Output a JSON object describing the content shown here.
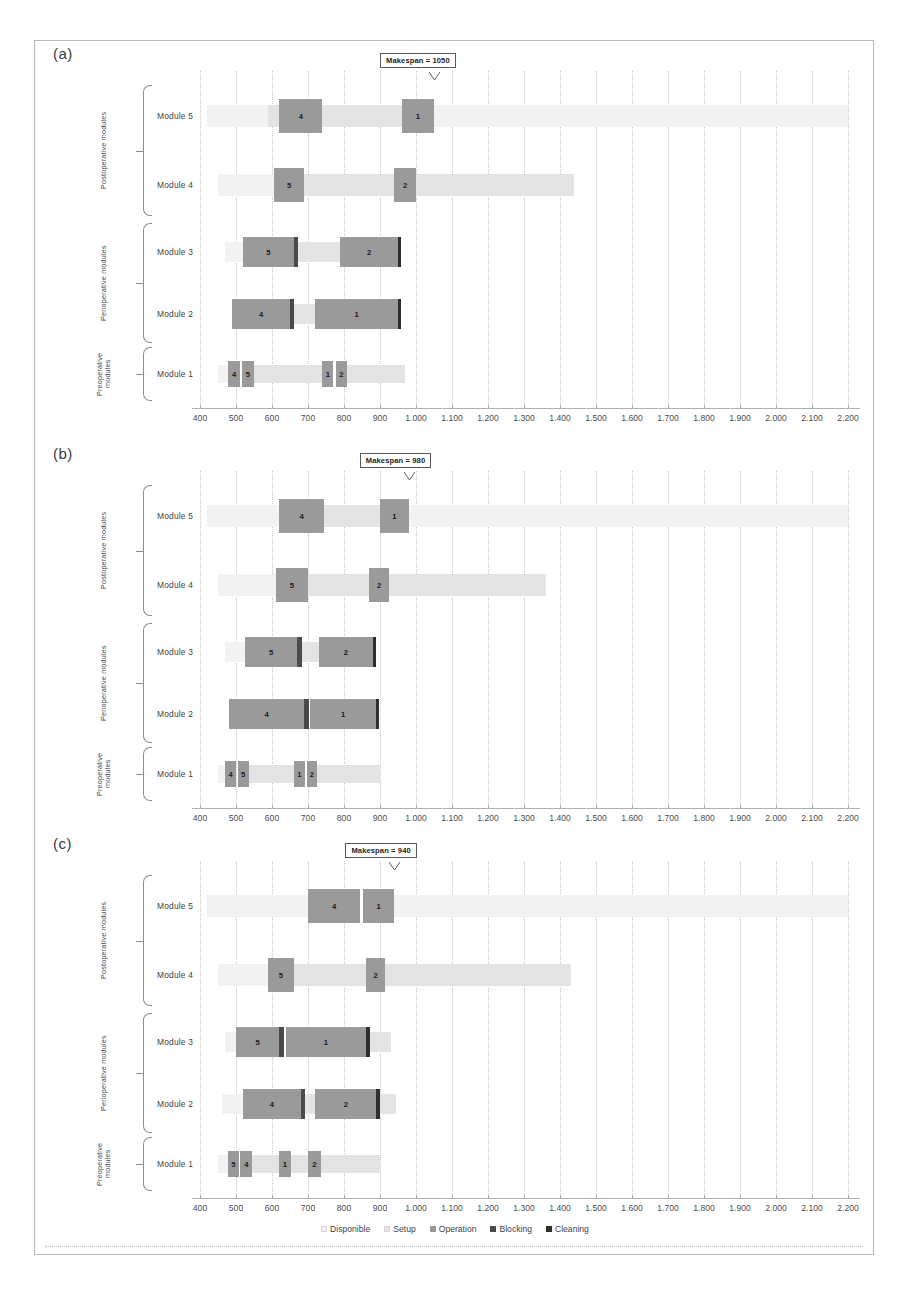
{
  "figure": {
    "axis": {
      "min": 400,
      "max": 2200,
      "step": 100,
      "tick_labels": [
        "400",
        "500",
        "600",
        "700",
        "800",
        "900",
        "1.000",
        "1.100",
        "1.200",
        "1.300",
        "1.400",
        "1.500",
        "1.600",
        "1.700",
        "1.800",
        "1.900",
        "2.000",
        "2.100",
        "2.200"
      ]
    },
    "groups": [
      {
        "label": "Postoperative modules",
        "rows": [
          "Module 5",
          "Module 4"
        ]
      },
      {
        "label": "Perioperative modules",
        "rows": [
          "Module 3",
          "Module 2"
        ]
      },
      {
        "label": "Preoperative modules",
        "rows": [
          "Module 1"
        ]
      }
    ],
    "legend": {
      "items": [
        {
          "label": "Disponible",
          "color": "#f2f2f2"
        },
        {
          "label": "Setup",
          "color": "#e3e3e3"
        },
        {
          "label": "Operation",
          "color": "#9a9a9a"
        },
        {
          "label": "Blocking",
          "color": "#4a4a4a"
        },
        {
          "label": "Cleaning",
          "color": "#2e2e2e"
        }
      ]
    },
    "colors": {
      "disponible": "#f2f2f2",
      "setup": "#e3e3e3",
      "operation": "#9a9a9a",
      "blocking": "#4a4a4a",
      "cleaning": "#2e2e2e",
      "grid": "#c4c4c4",
      "frame": "#b9b9b9",
      "text": "#3f3f3f"
    }
  },
  "chart_data": {
    "type": "bar",
    "chart_kind": "gantt",
    "xlabel": "",
    "ylabel": "",
    "xlim": [
      400,
      2200
    ],
    "grid": true,
    "legend_position": "bottom",
    "categories": [
      "Module 5",
      "Module 4",
      "Module 3",
      "Module 2",
      "Module 1"
    ],
    "panels": [
      {
        "id": "a",
        "label": "(a)",
        "makespan_label": "Makespan = 1050",
        "makespan_value": 1050,
        "rows": [
          {
            "name": "Module 5",
            "segments": [
              {
                "type": "disponible",
                "start": 420,
                "end": 590
              },
              {
                "type": "setup",
                "start": 590,
                "end": 620
              },
              {
                "type": "operation",
                "start": 620,
                "end": 740,
                "label": "4"
              },
              {
                "type": "setup",
                "start": 740,
                "end": 960
              },
              {
                "type": "operation",
                "start": 960,
                "end": 1050,
                "label": "1"
              },
              {
                "type": "disponible",
                "start": 1050,
                "end": 2200
              }
            ]
          },
          {
            "name": "Module 4",
            "segments": [
              {
                "type": "disponible",
                "start": 450,
                "end": 605
              },
              {
                "type": "operation",
                "start": 605,
                "end": 690,
                "label": "5"
              },
              {
                "type": "setup",
                "start": 690,
                "end": 940
              },
              {
                "type": "operation",
                "start": 940,
                "end": 1000,
                "label": "2"
              },
              {
                "type": "setup",
                "start": 1000,
                "end": 1440
              }
            ]
          },
          {
            "name": "Module 3",
            "segments": [
              {
                "type": "disponible",
                "start": 470,
                "end": 520
              },
              {
                "type": "operation",
                "start": 520,
                "end": 660,
                "label": "5"
              },
              {
                "type": "blocking",
                "start": 660,
                "end": 672
              },
              {
                "type": "setup",
                "start": 672,
                "end": 790
              },
              {
                "type": "operation",
                "start": 790,
                "end": 950,
                "label": "2"
              },
              {
                "type": "cleaning",
                "start": 950,
                "end": 958
              }
            ]
          },
          {
            "name": "Module 2",
            "segments": [
              {
                "type": "operation",
                "start": 490,
                "end": 650,
                "label": "4"
              },
              {
                "type": "blocking",
                "start": 650,
                "end": 662
              },
              {
                "type": "setup",
                "start": 662,
                "end": 720
              },
              {
                "type": "operation",
                "start": 720,
                "end": 950,
                "label": "1"
              },
              {
                "type": "cleaning",
                "start": 950,
                "end": 958
              }
            ]
          },
          {
            "name": "Module 1",
            "segments": [
              {
                "type": "disponible",
                "start": 450,
                "end": 478
              },
              {
                "type": "operation",
                "start": 478,
                "end": 512,
                "label": "4"
              },
              {
                "type": "operation",
                "start": 516,
                "end": 550,
                "label": "5"
              },
              {
                "type": "setup",
                "start": 550,
                "end": 740
              },
              {
                "type": "operation",
                "start": 740,
                "end": 770,
                "label": "1"
              },
              {
                "type": "operation",
                "start": 778,
                "end": 808,
                "label": "2"
              },
              {
                "type": "setup",
                "start": 808,
                "end": 970
              }
            ]
          }
        ]
      },
      {
        "id": "b",
        "label": "(b)",
        "makespan_label": "Makespan = 980",
        "makespan_value": 980,
        "rows": [
          {
            "name": "Module 5",
            "segments": [
              {
                "type": "disponible",
                "start": 420,
                "end": 620
              },
              {
                "type": "operation",
                "start": 620,
                "end": 745,
                "label": "4"
              },
              {
                "type": "setup",
                "start": 745,
                "end": 900
              },
              {
                "type": "operation",
                "start": 900,
                "end": 980,
                "label": "1"
              },
              {
                "type": "disponible",
                "start": 980,
                "end": 2200
              }
            ]
          },
          {
            "name": "Module 4",
            "segments": [
              {
                "type": "disponible",
                "start": 450,
                "end": 610
              },
              {
                "type": "operation",
                "start": 610,
                "end": 700,
                "label": "5"
              },
              {
                "type": "setup",
                "start": 700,
                "end": 870
              },
              {
                "type": "operation",
                "start": 870,
                "end": 925,
                "label": "2"
              },
              {
                "type": "setup",
                "start": 925,
                "end": 1360
              }
            ]
          },
          {
            "name": "Module 3",
            "segments": [
              {
                "type": "disponible",
                "start": 470,
                "end": 525
              },
              {
                "type": "operation",
                "start": 525,
                "end": 670,
                "label": "5"
              },
              {
                "type": "blocking",
                "start": 670,
                "end": 682
              },
              {
                "type": "setup",
                "start": 682,
                "end": 730
              },
              {
                "type": "operation",
                "start": 730,
                "end": 880,
                "label": "2"
              },
              {
                "type": "cleaning",
                "start": 880,
                "end": 888
              }
            ]
          },
          {
            "name": "Module 2",
            "segments": [
              {
                "type": "operation",
                "start": 480,
                "end": 690,
                "label": "4"
              },
              {
                "type": "blocking",
                "start": 690,
                "end": 702
              },
              {
                "type": "operation",
                "start": 705,
                "end": 890,
                "label": "1"
              },
              {
                "type": "cleaning",
                "start": 890,
                "end": 898
              }
            ]
          },
          {
            "name": "Module 1",
            "segments": [
              {
                "type": "disponible",
                "start": 450,
                "end": 470
              },
              {
                "type": "operation",
                "start": 470,
                "end": 500,
                "label": "4"
              },
              {
                "type": "operation",
                "start": 505,
                "end": 535,
                "label": "5"
              },
              {
                "type": "setup",
                "start": 535,
                "end": 660
              },
              {
                "type": "operation",
                "start": 660,
                "end": 692,
                "label": "1"
              },
              {
                "type": "operation",
                "start": 696,
                "end": 726,
                "label": "2"
              },
              {
                "type": "setup",
                "start": 726,
                "end": 900
              }
            ]
          }
        ]
      },
      {
        "id": "c",
        "label": "(c)",
        "makespan_label": "Makespan = 940",
        "makespan_value": 940,
        "rows": [
          {
            "name": "Module 5",
            "segments": [
              {
                "type": "disponible",
                "start": 420,
                "end": 700
              },
              {
                "type": "operation",
                "start": 700,
                "end": 845,
                "label": "4"
              },
              {
                "type": "operation",
                "start": 852,
                "end": 940,
                "label": "1"
              },
              {
                "type": "disponible",
                "start": 940,
                "end": 2200
              }
            ]
          },
          {
            "name": "Module 4",
            "segments": [
              {
                "type": "disponible",
                "start": 450,
                "end": 590
              },
              {
                "type": "operation",
                "start": 590,
                "end": 660,
                "label": "5"
              },
              {
                "type": "setup",
                "start": 660,
                "end": 860
              },
              {
                "type": "operation",
                "start": 860,
                "end": 915,
                "label": "2"
              },
              {
                "type": "setup",
                "start": 915,
                "end": 1430
              }
            ]
          },
          {
            "name": "Module 3",
            "segments": [
              {
                "type": "disponible",
                "start": 470,
                "end": 500
              },
              {
                "type": "operation",
                "start": 500,
                "end": 620,
                "label": "5"
              },
              {
                "type": "blocking",
                "start": 620,
                "end": 632
              },
              {
                "type": "operation",
                "start": 640,
                "end": 860,
                "label": "1"
              },
              {
                "type": "cleaning",
                "start": 860,
                "end": 872
              },
              {
                "type": "setup",
                "start": 872,
                "end": 930
              }
            ]
          },
          {
            "name": "Module 2",
            "segments": [
              {
                "type": "disponible",
                "start": 460,
                "end": 520
              },
              {
                "type": "operation",
                "start": 520,
                "end": 680,
                "label": "4"
              },
              {
                "type": "blocking",
                "start": 680,
                "end": 692
              },
              {
                "type": "setup",
                "start": 692,
                "end": 720
              },
              {
                "type": "operation",
                "start": 720,
                "end": 890,
                "label": "2"
              },
              {
                "type": "cleaning",
                "start": 890,
                "end": 900
              },
              {
                "type": "setup",
                "start": 900,
                "end": 945
              }
            ]
          },
          {
            "name": "Module 1",
            "segments": [
              {
                "type": "disponible",
                "start": 450,
                "end": 478
              },
              {
                "type": "operation",
                "start": 478,
                "end": 508,
                "label": "5"
              },
              {
                "type": "operation",
                "start": 512,
                "end": 545,
                "label": "4"
              },
              {
                "type": "setup",
                "start": 545,
                "end": 620
              },
              {
                "type": "operation",
                "start": 620,
                "end": 652,
                "label": "1"
              },
              {
                "type": "setup",
                "start": 652,
                "end": 700
              },
              {
                "type": "operation",
                "start": 700,
                "end": 735,
                "label": "2"
              },
              {
                "type": "setup",
                "start": 735,
                "end": 900
              }
            ]
          }
        ]
      }
    ]
  }
}
